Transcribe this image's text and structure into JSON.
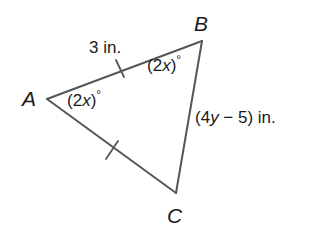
{
  "figure": {
    "type": "triangle-diagram",
    "background_color": "#ffffff",
    "stroke_color": "#55565a",
    "text_color": "#1a1a1a",
    "canvas": {
      "width": 314,
      "height": 247
    },
    "vertices": [
      {
        "name": "A",
        "label": "A",
        "x": 47,
        "y": 99
      },
      {
        "name": "B",
        "label": "B",
        "x": 202,
        "y": 41
      },
      {
        "name": "C",
        "label": "C",
        "x": 176,
        "y": 193
      }
    ],
    "sides": [
      {
        "name": "AB",
        "from": "A",
        "to": "B",
        "label_parts": {
          "prefix": "3 in.",
          "italic": "",
          "suffix": ""
        },
        "label_text": "3 in.",
        "tick_marks": 1,
        "tick_x": 120,
        "tick_y": 68
      },
      {
        "name": "BC",
        "from": "B",
        "to": "C",
        "label_parts": {
          "prefix": "(4",
          "italic": "y",
          "suffix": " − 5) in."
        },
        "label_text": "(4y − 5) in.",
        "tick_marks": 0
      },
      {
        "name": "AC",
        "from": "A",
        "to": "C",
        "label_text": "",
        "tick_marks": 1,
        "tick_x": 112,
        "tick_y": 150
      }
    ],
    "angles": [
      {
        "name": "angle-A",
        "at_vertex": "A",
        "prefix": "(2",
        "italic": "x",
        "suffix": ")",
        "degree_symbol": "°",
        "text": "(2x)°"
      },
      {
        "name": "angle-B",
        "at_vertex": "B",
        "prefix": "(2",
        "italic": "x",
        "suffix": ")",
        "degree_symbol": "°",
        "text": "(2x)°"
      }
    ]
  }
}
